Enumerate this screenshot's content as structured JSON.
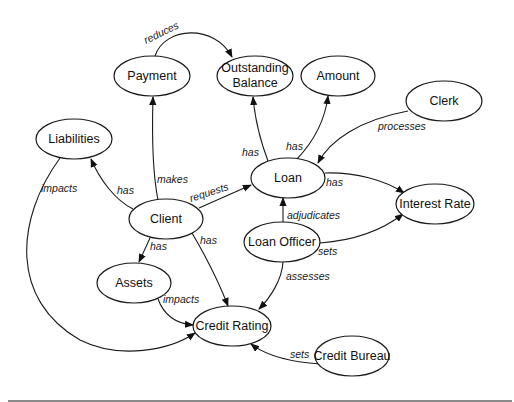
{
  "diagram": {
    "nodes": [
      {
        "id": "payment",
        "label": "Payment",
        "cx": 152,
        "cy": 76,
        "rx": 38,
        "ry": 20
      },
      {
        "id": "outstanding_balance",
        "label": "Outstanding",
        "label2": "Balance",
        "cx": 255,
        "cy": 76,
        "rx": 38,
        "ry": 20
      },
      {
        "id": "amount",
        "label": "Amount",
        "cx": 338,
        "cy": 76,
        "rx": 37,
        "ry": 20
      },
      {
        "id": "clerk",
        "label": "Clerk",
        "cx": 444,
        "cy": 101,
        "rx": 38,
        "ry": 20
      },
      {
        "id": "liabilities",
        "label": "Liabilities",
        "cx": 74,
        "cy": 139,
        "rx": 38,
        "ry": 20
      },
      {
        "id": "loan",
        "label": "Loan",
        "cx": 288,
        "cy": 178,
        "rx": 37,
        "ry": 20
      },
      {
        "id": "interest_rate",
        "label": "Interest Rate",
        "cx": 435,
        "cy": 204,
        "rx": 39,
        "ry": 20
      },
      {
        "id": "client",
        "label": "Client",
        "cx": 166,
        "cy": 219,
        "rx": 37,
        "ry": 20
      },
      {
        "id": "loan_officer",
        "label": "Loan Officer",
        "cx": 282,
        "cy": 242,
        "rx": 38,
        "ry": 20
      },
      {
        "id": "assets",
        "label": "Assets",
        "cx": 134,
        "cy": 283,
        "rx": 37,
        "ry": 20
      },
      {
        "id": "credit_rating",
        "label": "Credit Rating",
        "cx": 232,
        "cy": 326,
        "rx": 39,
        "ry": 20
      },
      {
        "id": "credit_bureau",
        "label": "Credit Bureau",
        "cx": 352,
        "cy": 356,
        "rx": 37,
        "ry": 20
      }
    ],
    "edges": [
      {
        "from": "payment",
        "to": "outstanding_balance",
        "label": "reduces"
      },
      {
        "from": "client",
        "to": "payment",
        "label": "makes"
      },
      {
        "from": "client",
        "to": "liabilities",
        "label": "has"
      },
      {
        "from": "client",
        "to": "loan",
        "label": "requests"
      },
      {
        "from": "client",
        "to": "assets",
        "label": "has"
      },
      {
        "from": "client",
        "to": "credit_rating",
        "label": "has"
      },
      {
        "from": "loan",
        "to": "outstanding_balance",
        "label": "has"
      },
      {
        "from": "loan",
        "to": "amount",
        "label": "has"
      },
      {
        "from": "loan",
        "to": "interest_rate",
        "label": "has"
      },
      {
        "from": "clerk",
        "to": "loan",
        "label": "processes"
      },
      {
        "from": "loan_officer",
        "to": "loan",
        "label": "adjudicates"
      },
      {
        "from": "loan_officer",
        "to": "interest_rate",
        "label": "sets"
      },
      {
        "from": "loan_officer",
        "to": "credit_rating",
        "label": "assesses"
      },
      {
        "from": "liabilities",
        "to": "credit_rating",
        "label": "impacts"
      },
      {
        "from": "assets",
        "to": "credit_rating",
        "label": "impacts"
      },
      {
        "from": "credit_bureau",
        "to": "credit_rating",
        "label": "sets"
      }
    ]
  },
  "labels": {
    "reduces": "reduces",
    "makes": "makes",
    "has": "has",
    "requests": "requests",
    "processes": "processes",
    "adjudicates": "adjudicates",
    "sets": "sets",
    "assesses": "assesses",
    "impacts": "impacts"
  },
  "colors": {
    "stroke": "#1a1a1a",
    "background": "#ffffff",
    "rule": "#8a8a8a"
  }
}
